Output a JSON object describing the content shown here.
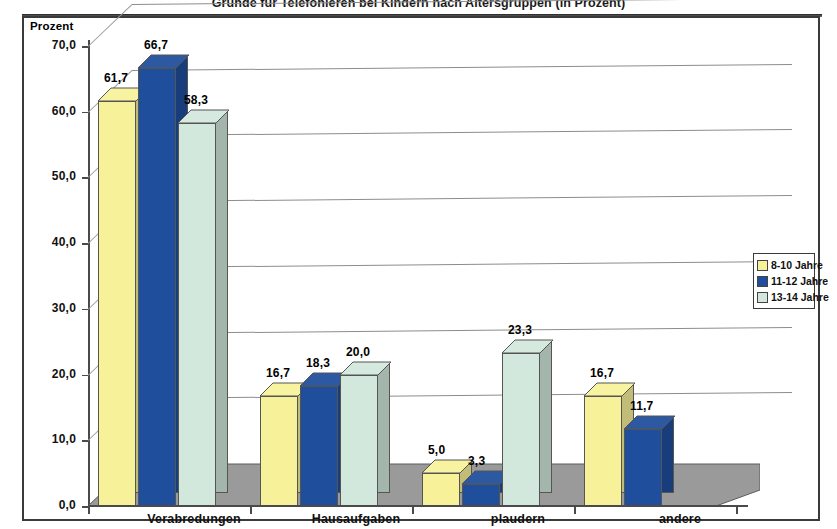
{
  "document": {
    "title_clipped": "Gründe für Telefonieren bei Kindern nach Altersgruppen (in Prozent)"
  },
  "axis": {
    "y_title": "Prozent",
    "y_ticks": [
      "70,0",
      "60,0",
      "50,0",
      "40,0",
      "30,0",
      "20,0",
      "10,0",
      "0,0"
    ]
  },
  "legend": {
    "items": [
      {
        "label": "8-10   Jahre",
        "color": "#F7F29A"
      },
      {
        "label": "11-12 Jahre",
        "color": "#1F4E9C"
      },
      {
        "label": "13-14 Jahre",
        "color": "#D2E8DC"
      }
    ]
  },
  "labels": {
    "g0s0": "61,7",
    "g0s1": "66,7",
    "g0s2": "58,3",
    "g1s0": "16,7",
    "g1s1": "18,3",
    "g1s2": "20,0",
    "g2s0": "5,0",
    "g2s1": "3,3",
    "g2s2": "23,3",
    "g3s0": "16,7",
    "g3s1": "11,7"
  },
  "categories": {
    "c0": "Verabredungen",
    "c1": "Hausaufgaben",
    "c2": "plaudern",
    "c3": "andere"
  },
  "chart_data": {
    "type": "bar",
    "title": "Gründe für Telefonieren bei Kindern nach Altersgruppen (in Prozent)",
    "xlabel": "",
    "ylabel": "Prozent",
    "ylim": [
      0,
      70
    ],
    "ytick_step": 10,
    "grid": true,
    "legend_position": "right",
    "value_labels": true,
    "decimal_separator": ",",
    "three_d": true,
    "categories": [
      "Verabredungen",
      "Hausaufgaben",
      "plaudern",
      "andere"
    ],
    "series": [
      {
        "name": "8-10   Jahre",
        "color": "#F7F29A",
        "values": [
          61.7,
          16.7,
          5.0,
          16.7
        ]
      },
      {
        "name": "11-12 Jahre",
        "color": "#1F4E9C",
        "values": [
          66.7,
          18.3,
          3.3,
          11.7
        ]
      },
      {
        "name": "13-14 Jahre",
        "color": "#D2E8DC",
        "values": [
          58.3,
          20.0,
          23.3,
          0.0
        ]
      }
    ]
  }
}
